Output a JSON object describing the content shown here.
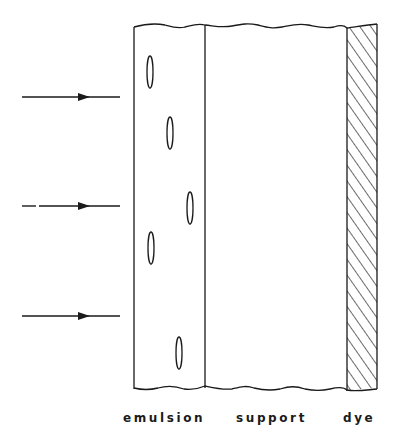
{
  "diagram": {
    "colors": {
      "stroke": "#1a1a1a",
      "background": "#ffffff"
    },
    "layers": [
      {
        "id": "emulsion",
        "label": "emulsion"
      },
      {
        "id": "support",
        "label": "support"
      },
      {
        "id": "dye",
        "label": "dye",
        "fill": "hatched"
      }
    ],
    "incident_arrows": [
      {
        "y": 97
      },
      {
        "y": 206
      },
      {
        "y": 316
      }
    ],
    "grains": [
      {
        "cx": 150,
        "cy": 72
      },
      {
        "cx": 170,
        "cy": 133
      },
      {
        "cx": 190,
        "cy": 208
      },
      {
        "cx": 151,
        "cy": 248
      },
      {
        "cx": 179,
        "cy": 353
      }
    ]
  }
}
